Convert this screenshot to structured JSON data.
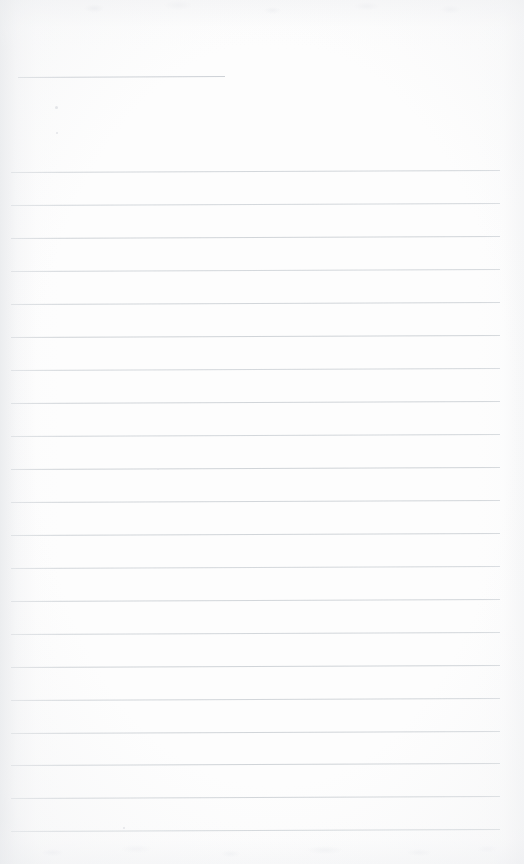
{
  "document": {
    "kind": "scanned-lined-notepad-page",
    "title": "Blank Ruled Notepad Page",
    "orientation": "portrait",
    "page_width": 524,
    "page_height": 864,
    "content_text": "",
    "has_handwriting": false,
    "has_printed_text": false
  },
  "palette": {
    "paper": "#fdfdfd",
    "rule_line": "#c9ced3",
    "header_rule": "#c4c9cf",
    "shadow_edge": "#e4e6e9",
    "speck": "#e3e5e8"
  },
  "layout": {
    "rule_left_x": 11,
    "rule_right_x": 500,
    "rule_thickness": 1,
    "rule_spacing": 33,
    "first_rule_y": 172,
    "last_rule_y": 831,
    "rule_tilt_deg": -0.22,
    "header_rule": {
      "x": 18,
      "y": 77,
      "width": 207,
      "tilt_deg": -0.28
    }
  },
  "rules": [
    {
      "index": 1,
      "y": 172,
      "x": 11,
      "width": 489,
      "tilt": -0.22,
      "opacity": 0.82
    },
    {
      "index": 2,
      "y": 205,
      "x": 11,
      "width": 489,
      "tilt": -0.22,
      "opacity": 0.8
    },
    {
      "index": 3,
      "y": 238,
      "x": 11,
      "width": 489,
      "tilt": -0.22,
      "opacity": 0.86
    },
    {
      "index": 4,
      "y": 271,
      "x": 11,
      "width": 489,
      "tilt": -0.22,
      "opacity": 0.8
    },
    {
      "index": 5,
      "y": 304,
      "x": 11,
      "width": 489,
      "tilt": -0.22,
      "opacity": 0.84
    },
    {
      "index": 6,
      "y": 337,
      "x": 11,
      "width": 489,
      "tilt": -0.22,
      "opacity": 0.88
    },
    {
      "index": 7,
      "y": 370,
      "x": 11,
      "width": 489,
      "tilt": -0.22,
      "opacity": 0.8
    },
    {
      "index": 8,
      "y": 403,
      "x": 11,
      "width": 489,
      "tilt": -0.22,
      "opacity": 0.86
    },
    {
      "index": 9,
      "y": 436,
      "x": 11,
      "width": 489,
      "tilt": -0.22,
      "opacity": 0.82
    },
    {
      "index": 10,
      "y": 469,
      "x": 11,
      "width": 489,
      "tilt": -0.22,
      "opacity": 0.88
    },
    {
      "index": 11,
      "y": 502,
      "x": 11,
      "width": 489,
      "tilt": -0.22,
      "opacity": 0.84
    },
    {
      "index": 12,
      "y": 535,
      "x": 11,
      "width": 489,
      "tilt": -0.22,
      "opacity": 0.86
    },
    {
      "index": 13,
      "y": 568,
      "x": 11,
      "width": 489,
      "tilt": -0.22,
      "opacity": 0.8
    },
    {
      "index": 14,
      "y": 601,
      "x": 11,
      "width": 489,
      "tilt": -0.22,
      "opacity": 0.84
    },
    {
      "index": 15,
      "y": 634,
      "x": 11,
      "width": 489,
      "tilt": -0.22,
      "opacity": 0.82
    },
    {
      "index": 16,
      "y": 667,
      "x": 11,
      "width": 489,
      "tilt": -0.22,
      "opacity": 0.88
    },
    {
      "index": 17,
      "y": 700,
      "x": 11,
      "width": 489,
      "tilt": -0.22,
      "opacity": 0.84
    },
    {
      "index": 18,
      "y": 733,
      "x": 11,
      "width": 489,
      "tilt": -0.22,
      "opacity": 0.86
    },
    {
      "index": 19,
      "y": 765,
      "x": 11,
      "width": 489,
      "tilt": -0.22,
      "opacity": 0.88
    },
    {
      "index": 20,
      "y": 798,
      "x": 11,
      "width": 489,
      "tilt": -0.22,
      "opacity": 0.86
    },
    {
      "index": 21,
      "y": 831,
      "x": 11,
      "width": 489,
      "tilt": -0.22,
      "opacity": 0.9
    }
  ],
  "specks": [
    {
      "x": 55,
      "y": 106,
      "size": 3
    },
    {
      "x": 56,
      "y": 132,
      "size": 2
    },
    {
      "x": 157,
      "y": 468,
      "size": 2
    },
    {
      "x": 123,
      "y": 827,
      "size": 2
    }
  ]
}
